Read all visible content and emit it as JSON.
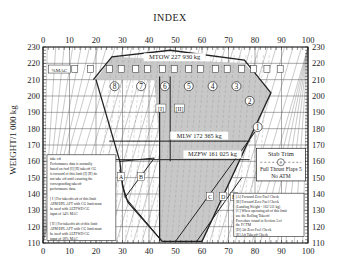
{
  "chart_data": {
    "type": "line",
    "title": "INDEX",
    "xlabel": "INDEX",
    "ylabel": "WEIGHT/1 000 kg",
    "xlim": [
      0,
      100
    ],
    "ylim": [
      110,
      230
    ],
    "x_ticks": [
      0,
      10,
      20,
      30,
      40,
      50,
      60,
      70,
      80,
      90,
      100
    ],
    "y_ticks": [
      110,
      120,
      130,
      140,
      150,
      160,
      170,
      180,
      190,
      200,
      210,
      220,
      230
    ],
    "grid": true,
    "limits": [
      {
        "name": "MTOW",
        "label": "MTOW 227 930 kg",
        "weight": 227.93
      },
      {
        "name": "MLW",
        "label": "MLW 172 365 kg",
        "weight": 172.365
      },
      {
        "name": "MZFW",
        "label": "MZFW 161 025 kg",
        "weight": 161.025
      }
    ],
    "envelope": {
      "name": "Shaded CG envelope",
      "points": [
        [
          20,
          210
        ],
        [
          26,
          224
        ],
        [
          76,
          220
        ],
        [
          86,
          202
        ],
        [
          80,
          178
        ],
        [
          76,
          166
        ],
        [
          60,
          110
        ],
        [
          44,
          110
        ],
        [
          44,
          170
        ],
        [
          42,
          210
        ]
      ]
    },
    "takeoff_envelope": {
      "name": "Takeoff envelope (outer)",
      "points": [
        [
          19,
          210
        ],
        [
          26,
          224
        ],
        [
          48,
          228
        ],
        [
          76,
          222
        ],
        [
          86,
          202
        ],
        [
          60,
          111
        ],
        [
          45,
          111
        ],
        [
          32,
          135
        ],
        [
          30,
          145
        ],
        [
          29,
          160
        ],
        [
          20,
          210
        ]
      ]
    },
    "zfw_lines": [
      {
        "name": "A-B",
        "points": [
          [
            29,
            160
          ],
          [
            42,
            162
          ]
        ]
      },
      {
        "name": "A-low",
        "points": [
          [
            29,
            155
          ],
          [
            31,
            138
          ],
          [
            45,
            111
          ]
        ]
      },
      {
        "name": "B-diag",
        "points": [
          [
            42,
            162
          ],
          [
            31,
            138
          ]
        ]
      },
      {
        "name": "C-E",
        "points": [
          [
            50,
            111
          ],
          [
            80,
            178
          ]
        ]
      },
      {
        "name": "D",
        "points": [
          [
            58,
            111
          ],
          [
            75,
            150
          ]
        ]
      }
    ],
    "stab_trim_markers": [
      "%MAC",
      "0",
      "8",
      "8",
      "7",
      "7",
      "6",
      "6",
      "5",
      "5",
      "4",
      "4",
      "3",
      "3",
      "2",
      "2",
      "1"
    ],
    "region_labels": [
      "8",
      "7",
      "6",
      "5",
      "4",
      "3",
      "2",
      "1"
    ],
    "point_labels": [
      "[I]",
      "[II]",
      "A",
      "B",
      "C",
      "D",
      "E"
    ],
    "series": [
      {
        "name": "Stab trim unit 8",
        "x": 27,
        "y": 206
      },
      {
        "name": "Stab trim unit 7",
        "x": 37,
        "y": 206
      },
      {
        "name": "Stab trim unit 6",
        "x": 46,
        "y": 206
      },
      {
        "name": "Stab trim unit 5",
        "x": 55,
        "y": 206
      },
      {
        "name": "Stab trim unit 4",
        "x": 64,
        "y": 206
      },
      {
        "name": "Stab trim unit 3",
        "x": 73,
        "y": 206
      },
      {
        "name": "Stab trim unit 2",
        "x": 78,
        "y": 197
      },
      {
        "name": "Stab trim unit 1",
        "x": 81,
        "y": 181
      }
    ]
  },
  "title": "INDEX",
  "ylabel": "WEIGHT/1 000 kg",
  "mtow_label": "MTOW 227 930 kg",
  "mlw_label": "MLW 172 365 kg",
  "mzfw_label": "MZFW 161 025 kg",
  "mac_label": "%MAC",
  "markers": {
    "I": "[I]",
    "II": "[II]",
    "A": "A",
    "B": "B",
    "C": "C",
    "D": "D",
    "E": "E"
  },
  "stab_trim_box": {
    "title": "Stab Trim",
    "unit": "#",
    "line2": "Full Thrust Flaps 5",
    "line3": "No ATM"
  },
  "takeoff_note": {
    "lines": [
      "take off",
      "Performance data is normally",
      "based on fwd [I] [II] takeoff CG",
      "is forward of this limit [I] [II] do",
      "not take off until ensuring the",
      "corresponding takeoff",
      "performance data.",
      "",
      "[ I ] For takeoffs aft of this limit",
      "APM/DPL AFT with CG limit must",
      "be used with ALTFWD CG",
      "input of 14% MAC",
      "",
      "[ II ] For takeoffs aft of this limit",
      "APM/DPL AFT with CG limit must",
      "be used with ALTFWD CG",
      "input of 18% MAC"
    ]
  },
  "legend_note": {
    "lines": [
      "[A] Forward Zero Fuel Check",
      "[B] Forward Zero Fuel Check",
      "(Landing Weight - 162 511 kg)",
      "[C] When operating aft of this limit",
      "use the Rolling Takeoff",
      "Procedure found in Section 3 of",
      "the FCTM",
      "[D] Aft Zero Fuel Check",
      "[E] Aft Takeoff Check"
    ]
  },
  "colors": {
    "shade": "#c8c8c8",
    "grid": "#555555",
    "line": "#222222",
    "background": "#ffffff"
  }
}
